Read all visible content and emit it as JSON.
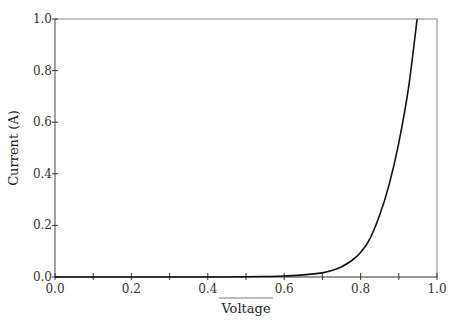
{
  "chart_data": {
    "type": "line",
    "title": "",
    "xlabel": "Voltage",
    "ylabel": "Current (A)",
    "xlim": [
      0.0,
      1.0
    ],
    "ylim": [
      0.0,
      1.0
    ],
    "grid": false,
    "x_ticks": [
      0.0,
      0.2,
      0.4,
      0.6,
      0.8,
      1.0
    ],
    "x_tick_labels": [
      "0.0",
      "0.2",
      "0.4",
      "0.6",
      "0.8",
      "1.0"
    ],
    "x_minor_ticks": [
      0.1,
      0.3,
      0.5,
      0.7,
      0.9
    ],
    "y_ticks": [
      0.0,
      0.2,
      0.4,
      0.6,
      0.8,
      1.0
    ],
    "y_tick_labels": [
      "0.0",
      "0.2",
      "0.4",
      "0.6",
      "0.8",
      "1.0"
    ],
    "series": [
      {
        "name": "I-V curve",
        "color": "#111111",
        "x": [
          0.0,
          0.1,
          0.2,
          0.3,
          0.4,
          0.5,
          0.55,
          0.6,
          0.65,
          0.7,
          0.725,
          0.75,
          0.775,
          0.8,
          0.825,
          0.85,
          0.875,
          0.9,
          0.925,
          0.948
        ],
        "y": [
          0.0,
          0.0,
          0.0,
          0.0,
          0.0,
          0.001,
          0.002,
          0.004,
          0.008,
          0.016,
          0.025,
          0.04,
          0.062,
          0.095,
          0.15,
          0.24,
          0.36,
          0.52,
          0.73,
          1.0
        ]
      }
    ]
  }
}
